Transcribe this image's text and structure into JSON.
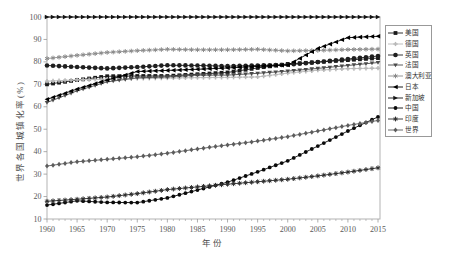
{
  "figure": {
    "background": "#ffffff"
  },
  "axes": {
    "frame_color": "#b3b3b3",
    "tick_color": "#999999",
    "tick_label_color": "#595959",
    "axis_label_color": "#4d4d4d"
  },
  "legend": {
    "position": "right",
    "border_color": "#999999"
  },
  "chart_data": {
    "type": "line",
    "title": "",
    "xlabel": "年份",
    "ylabel": "世界各国城镇化率(%)",
    "xlim": [
      1960,
      2015
    ],
    "ylim": [
      10,
      100
    ],
    "xticks": [
      1960,
      1965,
      1970,
      1975,
      1980,
      1985,
      1990,
      1995,
      2000,
      2005,
      2010,
      2015
    ],
    "yticks": [
      10,
      20,
      30,
      40,
      50,
      60,
      70,
      80,
      90,
      100
    ],
    "grid": false,
    "legend_position": "right",
    "x": [
      1960,
      1965,
      1970,
      1975,
      1980,
      1985,
      1990,
      1995,
      2000,
      2005,
      2010,
      2015
    ],
    "series": [
      {
        "name": "美国",
        "marker": "square",
        "color": "#1a1a1a",
        "values": [
          70.0,
          71.9,
          73.6,
          73.7,
          73.7,
          74.5,
          75.3,
          77.3,
          79.1,
          79.9,
          80.8,
          81.7
        ]
      },
      {
        "name": "德国",
        "marker": "plus",
        "color": "#b8b8b8",
        "values": [
          71.4,
          72.0,
          72.3,
          72.6,
          72.8,
          73.0,
          73.1,
          73.3,
          75.0,
          76.3,
          77.0,
          77.2
        ]
      },
      {
        "name": "英国",
        "marker": "circle",
        "color": "#1f1f1f",
        "values": [
          78.4,
          77.7,
          77.1,
          77.7,
          78.5,
          78.4,
          78.1,
          78.4,
          78.7,
          79.9,
          81.3,
          82.6
        ]
      },
      {
        "name": "法国",
        "marker": "triangle-down",
        "color": "#4a4a4a",
        "values": [
          61.9,
          67.1,
          71.1,
          72.9,
          73.3,
          74.1,
          74.1,
          74.9,
          75.9,
          77.1,
          78.4,
          79.7
        ]
      },
      {
        "name": "澳大利亚",
        "marker": "asterisk",
        "color": "#8a8a8a",
        "values": [
          81.5,
          82.9,
          84.2,
          85.0,
          85.6,
          85.4,
          85.4,
          85.6,
          84.9,
          85.1,
          85.5,
          85.7
        ]
      },
      {
        "name": "日本",
        "marker": "triangle-left",
        "color": "#000000",
        "values": [
          63.3,
          67.9,
          71.9,
          75.7,
          76.2,
          76.7,
          77.3,
          78.0,
          78.6,
          86.0,
          90.8,
          91.4
        ]
      },
      {
        "name": "新加坡",
        "marker": "triangle-right",
        "color": "#141414",
        "values": [
          100,
          100,
          100,
          100,
          100,
          100,
          100,
          100,
          100,
          100,
          100,
          100
        ]
      },
      {
        "name": "中国",
        "marker": "circle-small",
        "color": "#0a0a0a",
        "values": [
          16.2,
          18.1,
          17.4,
          17.3,
          19.4,
          22.9,
          26.4,
          31.0,
          35.9,
          42.5,
          49.2,
          55.5
        ]
      },
      {
        "name": "印度",
        "marker": "star",
        "color": "#2e2e2e",
        "values": [
          17.9,
          18.8,
          19.8,
          21.3,
          23.1,
          24.3,
          25.5,
          26.6,
          27.7,
          29.2,
          30.9,
          32.8
        ]
      },
      {
        "name": "世界",
        "marker": "diamond",
        "color": "#5c5c5c",
        "values": [
          33.6,
          35.5,
          36.6,
          37.7,
          39.3,
          41.2,
          43.0,
          44.7,
          46.7,
          49.2,
          51.7,
          53.9
        ]
      }
    ]
  }
}
